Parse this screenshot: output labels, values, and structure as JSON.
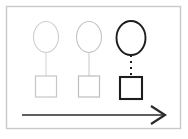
{
  "diagram": {
    "canvas": {
      "width": 188,
      "height": 139,
      "background": "#ffffff"
    },
    "frame": {
      "label": "diagram-border",
      "x": 6.5,
      "y": 6.5,
      "width": 174,
      "height": 122,
      "stroke": "#c9c9c9",
      "stroke_width": 1.4
    },
    "groups": [
      {
        "id": "group-1",
        "emphasis": "faint",
        "ellipse": {
          "label": "ellipse-1",
          "cx": 46,
          "cy": 37,
          "rx": 12.5,
          "ry": 15.5,
          "stroke": "#cfcfcf",
          "stroke_width": 1.1,
          "fill": "#ffffff"
        },
        "connector": {
          "label": "connector-1",
          "x1": 46,
          "y1": 52.5,
          "x2": 46,
          "y2": 76,
          "stroke": "#d2d2d2",
          "stroke_width": 1,
          "style": "solid",
          "dash": "none"
        },
        "square": {
          "label": "square-1",
          "x": 35.5,
          "y": 76,
          "width": 21,
          "height": 21,
          "stroke": "#c6c6c6",
          "stroke_width": 1.2,
          "fill": "#ffffff"
        }
      },
      {
        "id": "group-2",
        "emphasis": "faint",
        "ellipse": {
          "label": "ellipse-2",
          "cx": 89,
          "cy": 37,
          "rx": 12.5,
          "ry": 15.5,
          "stroke": "#c4c4c4",
          "stroke_width": 1.1,
          "fill": "#ffffff"
        },
        "connector": {
          "label": "connector-2",
          "x1": 89,
          "y1": 52.5,
          "x2": 89,
          "y2": 76,
          "stroke": "#c9c9c9",
          "stroke_width": 1,
          "style": "solid",
          "dash": "none"
        },
        "square": {
          "label": "square-2",
          "x": 78.5,
          "y": 76,
          "width": 21,
          "height": 21,
          "stroke": "#bdbdbd",
          "stroke_width": 1.2,
          "fill": "#ffffff"
        }
      },
      {
        "id": "group-3",
        "emphasis": "bold",
        "ellipse": {
          "label": "ellipse-3",
          "cx": 131,
          "cy": 38,
          "rx": 14.5,
          "ry": 17,
          "stroke": "#1d1d1d",
          "stroke_width": 1.9,
          "fill": "#ffffff"
        },
        "connector": {
          "label": "connector-3",
          "x1": 131,
          "y1": 55,
          "x2": 131,
          "y2": 77,
          "stroke": "#1d1d1d",
          "stroke_width": 2,
          "style": "dotted",
          "dash": "2 4"
        },
        "square": {
          "label": "square-3",
          "x": 120,
          "y": 77,
          "width": 22,
          "height": 22,
          "stroke": "#1d1d1d",
          "stroke_width": 2.1,
          "fill": "#ffffff"
        }
      }
    ],
    "arrow": {
      "label": "progression-arrow",
      "direction": "right",
      "x1": 22,
      "y1": 115,
      "x2": 164,
      "y2": 115,
      "stroke": "#2a2a2a",
      "stroke_width": 1.7,
      "head_points": "151,106 165,115 151,124",
      "head_stroke_width": 2.2
    }
  }
}
